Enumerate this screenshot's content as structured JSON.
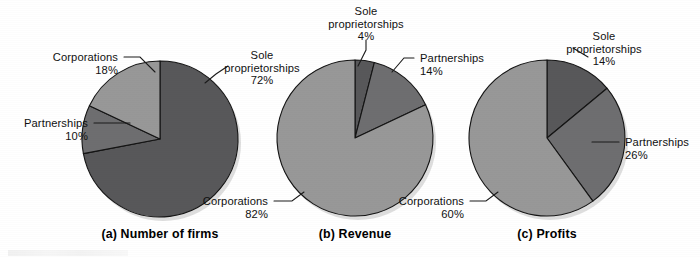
{
  "figure": {
    "background_color": "#ffffff",
    "width": 700,
    "height": 257
  },
  "palette": {
    "sole_proprietorships": "#58585a",
    "partnerships": "#6e6e70",
    "corporations": "#989898",
    "slice_outline": "#141414",
    "leader_line": "#1a1a1a",
    "text": "#111111",
    "caption": "#000000",
    "shadow": "#d8d8d8"
  },
  "captions": {
    "a": "(a) Number of firms",
    "b": "(b) Revenue",
    "c": "(c) Profits"
  },
  "labels": {
    "sole": "Sole",
    "proprietorships": "proprietorships",
    "partnerships": "Partnerships",
    "corporations": "Corporations"
  },
  "chart_data": [
    {
      "type": "pie",
      "id": "number-of-firms",
      "title": "(a) Number of firms",
      "start_angle": 0,
      "direction": "clockwise",
      "center": [
        160,
        139
      ],
      "radius": 78,
      "categories": [
        "Sole proprietorships",
        "Partnerships",
        "Corporations"
      ],
      "values": [
        72,
        10,
        18
      ],
      "value_labels": [
        "72%",
        "10%",
        "18%"
      ],
      "colors": [
        "#58585a",
        "#6e6e70",
        "#989898"
      ],
      "legend": "callout-labels",
      "units": "percent"
    },
    {
      "type": "pie",
      "id": "revenue",
      "title": "(b) Revenue",
      "start_angle": 0,
      "direction": "clockwise",
      "center": [
        355,
        138
      ],
      "radius": 78,
      "categories": [
        "Sole proprietorships",
        "Partnerships",
        "Corporations"
      ],
      "values": [
        4,
        14,
        82
      ],
      "value_labels": [
        "4%",
        "14%",
        "82%"
      ],
      "colors": [
        "#58585a",
        "#6e6e70",
        "#989898"
      ],
      "legend": "callout-labels",
      "units": "percent"
    },
    {
      "type": "pie",
      "id": "profits",
      "title": "(c) Profits",
      "start_angle": 0,
      "direction": "clockwise",
      "center": [
        547,
        138
      ],
      "radius": 78,
      "categories": [
        "Sole proprietorships",
        "Partnerships",
        "Corporations"
      ],
      "values": [
        14,
        26,
        60
      ],
      "value_labels": [
        "14%",
        "26%",
        "60%"
      ],
      "colors": [
        "#58585a",
        "#6e6e70",
        "#989898"
      ],
      "legend": "callout-labels",
      "units": "percent"
    }
  ],
  "callouts": [
    {
      "chart": "a",
      "category": "Corporations",
      "lines": [
        "Corporations",
        "18%"
      ],
      "anchor": "end",
      "text_x": 118,
      "text_y": 61,
      "leader": [
        [
          124,
          57
        ],
        [
          140,
          57
        ],
        [
          155,
          72
        ]
      ]
    },
    {
      "chart": "a",
      "category": "Partnerships",
      "lines": [
        "Partnerships",
        "10%"
      ],
      "anchor": "end",
      "text_x": 88,
      "text_y": 127,
      "leader": [
        [
          94,
          123
        ],
        [
          130,
          123
        ]
      ]
    },
    {
      "chart": "a",
      "category": "Sole proprietorships",
      "lines": [
        "Sole",
        "proprietorships",
        "72%"
      ],
      "anchor": "middle",
      "text_x": 262,
      "text_y": 59,
      "leader": [
        [
          228,
          66
        ],
        [
          216,
          74
        ],
        [
          205,
          83
        ]
      ]
    },
    {
      "chart": "b",
      "category": "Corporations",
      "lines": [
        "Corporations",
        "82%"
      ],
      "anchor": "end",
      "text_x": 268,
      "text_y": 205,
      "leader": [
        [
          274,
          201
        ],
        [
          292,
          201
        ],
        [
          304,
          192
        ]
      ]
    },
    {
      "chart": "b",
      "category": "Sole proprietorships",
      "lines": [
        "Sole",
        "proprietorships",
        "4%"
      ],
      "anchor": "middle",
      "text_x": 366,
      "text_y": 15,
      "leader": [
        [
          366,
          40
        ],
        [
          366,
          50
        ],
        [
          358,
          66
        ]
      ]
    },
    {
      "chart": "b",
      "category": "Partnerships",
      "lines": [
        "Partnerships",
        "14%"
      ],
      "anchor": "start",
      "text_x": 420,
      "text_y": 62,
      "leader": [
        [
          414,
          58
        ],
        [
          404,
          58
        ],
        [
          392,
          72
        ]
      ]
    },
    {
      "chart": "c",
      "category": "Corporations",
      "lines": [
        "Corporations",
        "60%"
      ],
      "anchor": "end",
      "text_x": 464,
      "text_y": 205,
      "leader": [
        [
          470,
          201
        ],
        [
          486,
          201
        ],
        [
          498,
          192
        ]
      ]
    },
    {
      "chart": "c",
      "category": "Sole proprietorships",
      "lines": [
        "Sole",
        "proprietorships",
        "14%"
      ],
      "anchor": "middle",
      "text_x": 604,
      "text_y": 40,
      "leader": [
        [
          573,
          48
        ],
        [
          588,
          57
        ],
        [
          588,
          57
        ]
      ]
    },
    {
      "chart": "c",
      "category": "Partnerships",
      "lines": [
        "Partnerships",
        "26%"
      ],
      "anchor": "start",
      "text_x": 625,
      "text_y": 146,
      "leader": [
        [
          619,
          142
        ],
        [
          592,
          142
        ]
      ]
    }
  ],
  "caption_positions": [
    {
      "key": "a",
      "x": 160,
      "y": 238
    },
    {
      "key": "b",
      "x": 355,
      "y": 238
    },
    {
      "key": "c",
      "x": 547,
      "y": 238
    }
  ]
}
